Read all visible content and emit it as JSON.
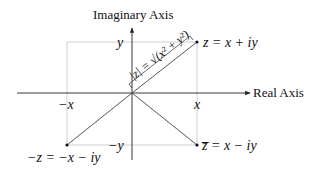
{
  "diagram": {
    "axes": {
      "imaginary_label": "Imaginary Axis",
      "real_label": "Real Axis"
    },
    "tick_labels": {
      "y": "y",
      "neg_y": "−y",
      "x": "x",
      "neg_x": "−x"
    },
    "points": {
      "z": "z = x + iy",
      "neg_z": "−z = −x − iy",
      "conj_z": "z̅ = x − iy"
    },
    "modulus_label": "|z| = √(x² + y²)",
    "modulus_parts": {
      "lhs": "|z| =",
      "radicand": "x² + y²"
    },
    "colors": {
      "axis": "#222222",
      "guide": "#bbbbbb",
      "vector": "#444444",
      "point": "#111111"
    }
  }
}
